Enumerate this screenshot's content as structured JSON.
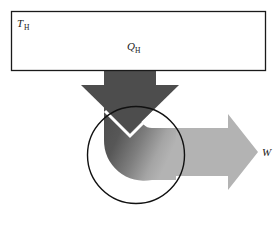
{
  "figure": {
    "background_color": "#ffffff"
  },
  "reservoir": {
    "label_main": "T",
    "label_sub": "H",
    "name": "hot-thermal-reservoir",
    "fill_color": "#ffffff",
    "border_color": "#1a1a1a",
    "x": 11,
    "y": 11,
    "width": 255,
    "height": 60
  },
  "heat_arrow": {
    "label_main": "Q",
    "label_sub": "H",
    "name": "heat-input-arrow",
    "color_start": "#545454",
    "color_end": "#8f8f8f",
    "direction": "down"
  },
  "work_arrow": {
    "label_main": "W",
    "label_sub": "",
    "name": "work-output-arrow",
    "color": "#b3b3b3",
    "direction": "right"
  },
  "engine": {
    "name": "engine-circle",
    "stroke_color": "#111111",
    "fill": "none",
    "cx": 136,
    "cy": 155,
    "r": 49
  },
  "notch": {
    "name": "arrow-notch",
    "color": "#ffffff"
  }
}
